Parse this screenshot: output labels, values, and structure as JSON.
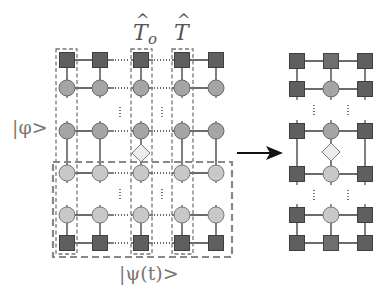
{
  "labels": {
    "phi_state": "|φ>",
    "psi_state": "|ψ(t)>",
    "op_T0": "T",
    "op_T0_sub": "o",
    "op_T": "T",
    "hat": "^"
  },
  "left_network": {
    "columns": 5,
    "rows": [
      "square",
      "circle-dark",
      "ellipsis",
      "circle-dark",
      "diamond",
      "circle-light",
      "ellipsis",
      "circle-light",
      "square"
    ],
    "horizontal_ellipsis_between_columns": [
      [
        2,
        3
      ],
      [
        3,
        4
      ]
    ],
    "highlighted_columns": [
      1,
      3,
      4
    ],
    "operator_columns": {
      "T_o": 3,
      "T": 4
    }
  },
  "right_network": {
    "columns": 3,
    "rows": [
      "square-row",
      "square-circle-square",
      "ellipsis",
      "square-circle-square",
      "diamond",
      "square-circle-square",
      "ellipsis",
      "square-circle-square",
      "square-row"
    ]
  },
  "colors": {
    "tensor_square": "#5f5f5f",
    "tensor_circle_dark": "#a5a5a5",
    "tensor_circle_light": "#c8c8c8",
    "operator_diamond": "#ececec",
    "dashed_box": "#888888",
    "arrow": "#111111"
  }
}
